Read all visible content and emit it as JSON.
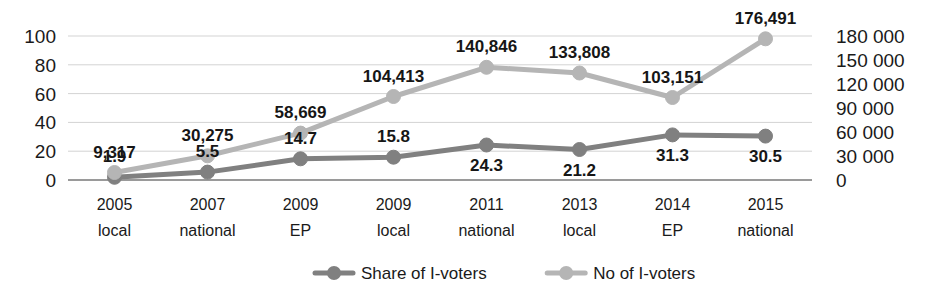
{
  "chart_data": {
    "type": "line",
    "title": "",
    "subtitle": "",
    "xlabel": "",
    "ylabel": "",
    "grid": true,
    "legend_position": "bottom",
    "categories": [
      "2005 local",
      "2007 national",
      "2009 EP",
      "2009 local",
      "2011 national",
      "2013 local",
      "2014 EP",
      "2015 national"
    ],
    "category_lines": [
      [
        "2005",
        "local"
      ],
      [
        "2007",
        "national"
      ],
      [
        "2009",
        "EP"
      ],
      [
        "2009",
        "local"
      ],
      [
        "2011",
        "national"
      ],
      [
        "2013",
        "local"
      ],
      [
        "2014",
        "EP"
      ],
      [
        "2015",
        "national"
      ]
    ],
    "axes": {
      "left": {
        "name": "Share of I-voters (%)",
        "ticks": [
          "0",
          "20",
          "40",
          "60",
          "80",
          "100"
        ],
        "tick_values": [
          0,
          20,
          40,
          60,
          80,
          100
        ],
        "min": 0,
        "max": 100
      },
      "right": {
        "name": "No of I-voters",
        "ticks": [
          "0",
          "30 000",
          "60 000",
          "90 000",
          "120 000",
          "150 000",
          "180 000"
        ],
        "tick_values": [
          0,
          30000,
          60000,
          90000,
          120000,
          150000,
          180000
        ],
        "min": 0,
        "max": 180000
      }
    },
    "series": [
      {
        "name": "Share of I-voters",
        "axis": "left",
        "color": "#808080",
        "marker": "circle",
        "values": [
          1.9,
          5.5,
          14.7,
          15.8,
          24.3,
          21.2,
          31.3,
          30.5
        ],
        "labels": [
          "1.9",
          "5.5",
          "14.7",
          "15.8",
          "24.3",
          "21.2",
          "31.3",
          "30.5"
        ],
        "label_positions": [
          "above",
          "above",
          "above",
          "above",
          "below",
          "below",
          "below",
          "below"
        ]
      },
      {
        "name": "No of I-voters",
        "axis": "right",
        "color": "#b5b5b5",
        "marker": "circle",
        "values": [
          9317,
          30275,
          58669,
          104413,
          140846,
          133808,
          103151,
          176491
        ],
        "labels": [
          "9,317",
          "30,275",
          "58,669",
          "104,413",
          "140,846",
          "133,808",
          "103,151",
          "176,491"
        ],
        "label_positions": [
          "above",
          "above",
          "above",
          "above",
          "above",
          "above",
          "above",
          "above"
        ]
      }
    ]
  },
  "legend": {
    "items": [
      {
        "label": "Share of I-voters",
        "color": "#808080"
      },
      {
        "label": "No of I-voters",
        "color": "#b5b5b5"
      }
    ]
  }
}
